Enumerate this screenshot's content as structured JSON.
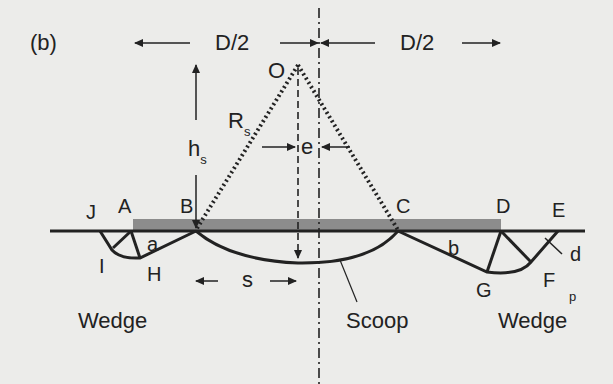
{
  "figure": {
    "panel_label": "(b)",
    "dimensions": {
      "left_half": "D/2",
      "right_half": "D/2",
      "height": "h",
      "height_sub": "s",
      "radius": "R",
      "radius_sub": "s",
      "eccentricity": "e",
      "offset": "s"
    },
    "points": {
      "O": "O",
      "A": "A",
      "B": "B",
      "C": "C",
      "D": "D",
      "E": "E",
      "F": "F",
      "G": "G",
      "H": "H",
      "I": "I",
      "J": "J"
    },
    "small_labels": {
      "a": "a",
      "b": "b",
      "d": "d",
      "p": "p"
    },
    "regions": {
      "left": "Wedge",
      "center": "Scoop",
      "right": "Wedge"
    },
    "colors": {
      "background": "#ececea",
      "ink": "#222222",
      "bar": "#8c8c8c"
    }
  }
}
